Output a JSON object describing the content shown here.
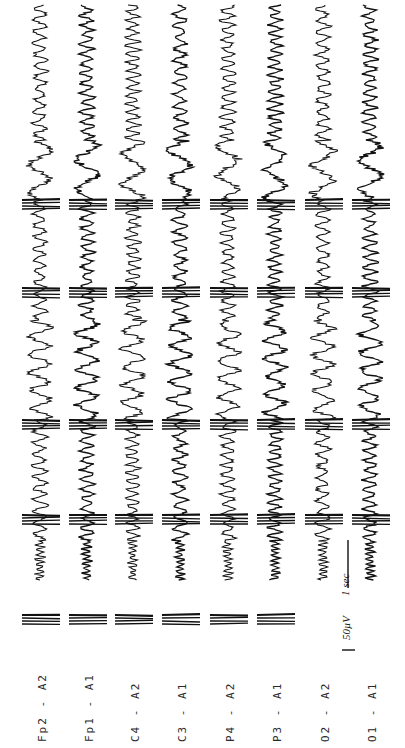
{
  "figure": {
    "type": "EEG recording (rotated 90°)",
    "orientation": "time runs bottom-to-top",
    "channels": [
      {
        "label": "Fp2 - A2",
        "x": 40
      },
      {
        "label": "Fp1 - A1",
        "x": 87
      },
      {
        "label": "C4 - A2",
        "x": 133
      },
      {
        "label": "C3 - A1",
        "x": 180
      },
      {
        "label": "P4 - A2",
        "x": 228
      },
      {
        "label": "P3 - A1",
        "x": 275
      },
      {
        "label": "O2 - A2",
        "x": 323
      },
      {
        "label": "O1 - A1",
        "x": 370
      }
    ],
    "scale_bar": {
      "amplitude_label": "50µV",
      "time_label": "1 sec"
    },
    "trace_color": "#111111",
    "label_color": "#2a2a2a"
  }
}
